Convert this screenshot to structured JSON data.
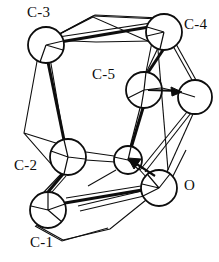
{
  "figure": {
    "kind": "molecular-structure-diagram",
    "style": "ortep-thermal-ellipsoid-wireframe",
    "width": 219,
    "height": 262,
    "background_color": "#ffffff",
    "stroke_color": "#0d0d0d",
    "fill_color": "#ffffff"
  },
  "labels": [
    {
      "id": "c3",
      "text": "C-3",
      "x": 27,
      "y": 5
    },
    {
      "id": "c4",
      "text": "C-4",
      "x": 184,
      "y": 17
    },
    {
      "id": "c5",
      "text": "C-5",
      "x": 92,
      "y": 67
    },
    {
      "id": "c2",
      "text": "C-2",
      "x": 14,
      "y": 158
    },
    {
      "id": "o",
      "text": "O",
      "x": 184,
      "y": 178
    },
    {
      "id": "c1",
      "text": "C-1",
      "x": 30,
      "y": 235
    }
  ],
  "atoms": [
    {
      "id": "c3",
      "label": "C-3",
      "cx": 46,
      "cy": 45,
      "r": 18
    },
    {
      "id": "c4",
      "label": "C-4",
      "cx": 164,
      "cy": 32,
      "r": 18
    },
    {
      "id": "c5",
      "label": "C-5",
      "cx": 144,
      "cy": 90,
      "r": 18
    },
    {
      "id": "x1",
      "label": "",
      "cx": 195,
      "cy": 97,
      "r": 17
    },
    {
      "id": "c2",
      "label": "C-2",
      "cx": 68,
      "cy": 157,
      "r": 18
    },
    {
      "id": "x2",
      "label": "",
      "cx": 128,
      "cy": 160,
      "r": 14
    },
    {
      "id": "o",
      "label": "O",
      "cx": 159,
      "cy": 188,
      "r": 18
    },
    {
      "id": "c1",
      "label": "C-1",
      "cx": 48,
      "cy": 210,
      "r": 18
    }
  ],
  "arrows": [
    {
      "id": "arrow-to-x1",
      "from_x": 148,
      "from_y": 90,
      "to_x": 182,
      "to_y": 92
    },
    {
      "id": "arrow-to-x2",
      "from_x": 152,
      "from_y": 172,
      "to_x": 128,
      "to_y": 158
    }
  ]
}
